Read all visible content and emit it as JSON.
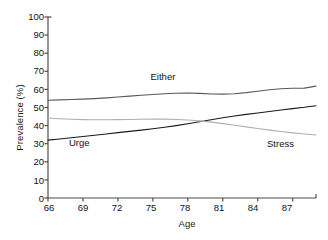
{
  "chart_data": {
    "type": "line",
    "title": "",
    "xlabel": "Age",
    "ylabel": "Prevalence (%)",
    "xlim": [
      66,
      89
    ],
    "ylim": [
      0,
      100
    ],
    "grid": false,
    "legend_position": "inline-annotations",
    "xticks": [
      66,
      69,
      72,
      75,
      78,
      81,
      84,
      87
    ],
    "yticks": [
      0,
      10,
      20,
      30,
      40,
      50,
      60,
      70,
      80,
      90,
      100
    ],
    "x": [
      66,
      67,
      68,
      69,
      70,
      71,
      72,
      73,
      74,
      75,
      76,
      77,
      78,
      79,
      80,
      81,
      82,
      83,
      84,
      85,
      86,
      87,
      88,
      89
    ],
    "series": [
      {
        "name": "Either",
        "color": "#595959",
        "values": [
          54.0,
          54.2,
          54.4,
          54.6,
          54.9,
          55.3,
          55.8,
          56.3,
          56.8,
          57.2,
          57.6,
          57.9,
          58.0,
          57.8,
          57.5,
          57.4,
          57.6,
          58.2,
          59.0,
          59.8,
          60.4,
          60.6,
          60.7,
          61.8
        ]
      },
      {
        "name": "Urge",
        "color": "#1a1a1a",
        "values": [
          32.0,
          32.6,
          33.3,
          34.0,
          34.7,
          35.4,
          36.1,
          36.8,
          37.5,
          38.3,
          39.1,
          40.0,
          41.0,
          42.1,
          43.2,
          44.3,
          45.3,
          46.2,
          47.0,
          47.8,
          48.6,
          49.4,
          50.1,
          51.0
        ]
      },
      {
        "name": "Stress",
        "color": "#b0b0b0",
        "values": [
          44.2,
          43.8,
          43.5,
          43.3,
          43.2,
          43.2,
          43.3,
          43.4,
          43.5,
          43.6,
          43.6,
          43.4,
          43.1,
          42.6,
          41.9,
          41.1,
          40.2,
          39.3,
          38.4,
          37.5,
          36.7,
          36.0,
          35.4,
          34.8
        ]
      }
    ],
    "annotations": [
      {
        "text": "Either",
        "x": 76.0,
        "y": 67.0
      },
      {
        "text": "Urge",
        "x": 69.0,
        "y": 30.5
      },
      {
        "text": "Stress",
        "x": 86.0,
        "y": 30.0
      }
    ]
  },
  "axis": {
    "y_tick_labels": [
      "100",
      "90",
      "80",
      "70",
      "60",
      "50",
      "40",
      "30",
      "20",
      "10",
      "0"
    ],
    "x_tick_labels": [
      "66",
      "69",
      "72",
      "75",
      "78",
      "81",
      "84",
      "87"
    ],
    "x_axis_title": "Age",
    "y_axis_title": "Prevalence (%)"
  },
  "style": {
    "axis_color": "#4d4d4d",
    "background": "#ffffff",
    "text_color": "#111111"
  }
}
